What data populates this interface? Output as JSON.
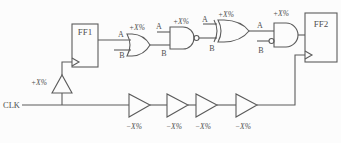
{
  "diagram": {
    "clk_label": "CLK",
    "ff1": {
      "label": "FF1"
    },
    "ff2": {
      "label": "FF2"
    },
    "clock_buffer": {
      "delay": "+X%"
    },
    "gates": [
      {
        "type": "or",
        "delay": "+X%",
        "input_a": "A",
        "input_b": "B"
      },
      {
        "type": "nand",
        "delay": "+X%",
        "input_a": "A",
        "input_b": "B"
      },
      {
        "type": "xor",
        "delay": "+X%",
        "input_a": "A",
        "input_b": "B"
      },
      {
        "type": "and-inverted-b",
        "delay": "+X%",
        "input_a": "A",
        "input_b": "B"
      }
    ],
    "clock_delay_buffers": [
      {
        "delay": "−X%"
      },
      {
        "delay": "−X%"
      },
      {
        "delay": "−X%"
      },
      {
        "delay": "−X%"
      }
    ],
    "colors": {
      "line": "#5b5b5b",
      "text": "#4f4f4f",
      "background": "#fcfcfc"
    }
  }
}
